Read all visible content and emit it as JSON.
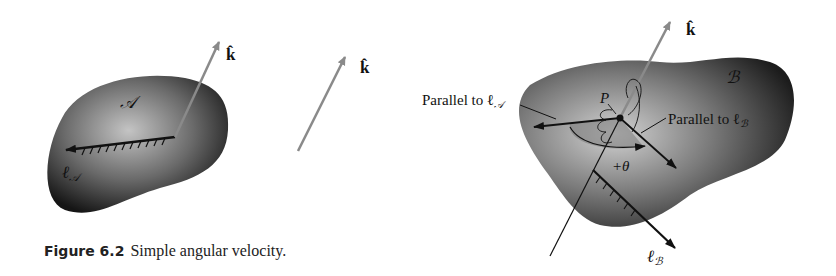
{
  "figure": {
    "number_label": "Figure 6.2",
    "caption": "Simple angular velocity."
  },
  "panel_left": {
    "body_label": "𝒜",
    "unit_vector_label": "k̂",
    "line_label": "ℓ",
    "line_subscript": "𝒜"
  },
  "panel_middle": {
    "unit_vector_label": "k̂"
  },
  "panel_right": {
    "body_label": "ℬ",
    "unit_vector_label": "k̂",
    "point_label": "P",
    "parallel_a_label": "Parallel to ℓ",
    "parallel_a_subscript": "𝒜",
    "parallel_b_label": "Parallel to ℓ",
    "parallel_b_subscript": "ℬ",
    "angle_label": "+θ",
    "line_label": "ℓ",
    "line_subscript": "ℬ"
  },
  "colors": {
    "body_dark": "#1a1a1a",
    "body_light": "#bdbdbd",
    "arrow_gray": "#8a8a8a",
    "ink": "#111111",
    "angle_fill": "#7a7a7a"
  }
}
